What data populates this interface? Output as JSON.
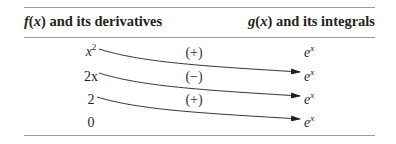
{
  "table": {
    "header": {
      "left": {
        "fn": "f",
        "var": "x",
        "rest": " and its derivatives"
      },
      "right": {
        "fn": "g",
        "var": "x",
        "rest": " and its integrals"
      }
    },
    "rows": [
      {
        "left_base": "x",
        "left_sup": "2",
        "sign": "(+)",
        "right_base": "e",
        "right_sup": "x"
      },
      {
        "left_base": "2x",
        "left_sup": "",
        "sign": "(−)",
        "right_base": "e",
        "right_sup": "x"
      },
      {
        "left_base": "2",
        "left_sup": "",
        "sign": "(+)",
        "right_base": "e",
        "right_sup": "x"
      },
      {
        "left_base": "0",
        "left_sup": "",
        "sign": "",
        "right_base": "e",
        "right_sup": "x"
      }
    ],
    "colors": {
      "rule": "#9a9a9a",
      "text": "#231f20",
      "arrow": "#231f20"
    }
  }
}
